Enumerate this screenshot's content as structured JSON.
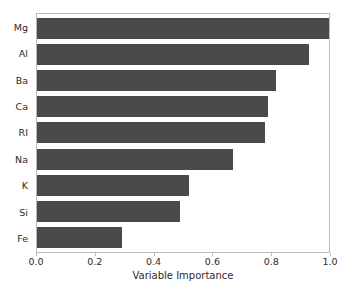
{
  "chart_data": {
    "type": "bar",
    "orientation": "horizontal",
    "title": "",
    "xlabel": "Variable Importance",
    "ylabel": "",
    "categories": [
      "Mg",
      "Al",
      "Ba",
      "Ca",
      "RI",
      "Na",
      "K",
      "Si",
      "Fe"
    ],
    "values": [
      1.0,
      0.93,
      0.82,
      0.79,
      0.78,
      0.67,
      0.52,
      0.49,
      0.29
    ],
    "xlim": [
      0.0,
      1.0
    ],
    "xticks": [
      "0.0",
      "0.2",
      "0.4",
      "0.6",
      "0.8",
      "1.0"
    ],
    "xtick_values": [
      0.0,
      0.2,
      0.4,
      0.6,
      0.8,
      1.0
    ],
    "grid": false,
    "legend": null,
    "colors": {
      "bar": "#4a4a4a",
      "frame": "#b9b9b9",
      "text": "#2b2b2b",
      "background": "#ffffff"
    }
  }
}
